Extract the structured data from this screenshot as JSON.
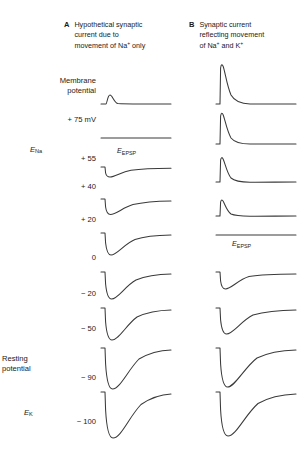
{
  "figure": {
    "trace_color": "#3a3a3a",
    "background": "#ffffff"
  },
  "panels": [
    {
      "id": "A",
      "letter": "A",
      "title": "Hypothetical synaptic\ncurrent due to\nmovement of Na+ only",
      "annotation": "E",
      "annotation_sub": "EPSP",
      "annotation_row": "+ 55"
    },
    {
      "id": "B",
      "letter": "B",
      "title": "Synaptic current\nreflecting movement\nof Na+ and K+",
      "annotation": "E",
      "annotation_sub": "EPSP",
      "annotation_row": "0"
    }
  ],
  "axis": {
    "label_group_1": "Membrane\npotential",
    "label_group_2": "Resting\npotential",
    "unit": "mV"
  },
  "rows": [
    {
      "value": "+ 75 mV",
      "prefix": "Membrane\npotential",
      "symbol": "",
      "symbol_sub": ""
    },
    {
      "value": "+ 55",
      "prefix": "",
      "symbol": "E",
      "symbol_sub": "Na"
    },
    {
      "value": "+ 40",
      "prefix": "",
      "symbol": "",
      "symbol_sub": ""
    },
    {
      "value": "+ 20",
      "prefix": "",
      "symbol": "",
      "symbol_sub": ""
    },
    {
      "value": "0",
      "prefix": "",
      "symbol": "",
      "symbol_sub": ""
    },
    {
      "value": "− 20",
      "prefix": "",
      "symbol": "",
      "symbol_sub": ""
    },
    {
      "value": "− 50",
      "prefix": "",
      "symbol": "",
      "symbol_sub": ""
    },
    {
      "value": "− 90",
      "prefix": "Resting\npotential",
      "symbol": "",
      "symbol_sub": ""
    },
    {
      "value": "− 100",
      "prefix": "",
      "symbol": "E",
      "symbol_sub": "K"
    }
  ],
  "chart_data": {
    "type": "line",
    "xlabel": "Time",
    "ylabel": "Synaptic current",
    "grid": false,
    "legend": "none",
    "note": "Each row is one holding potential. Amplitude is the peak synaptic current in arbitrary units; positive = upward (outward) deflection, negative = downward (inward) deflection. Panel A reverses at +55 mV (E_Na); panel B reverses at 0 mV (E_EPSP).",
    "categories": [
      "+ 75",
      "+ 55",
      "+ 40",
      "+ 20",
      "0",
      "− 20",
      "− 50",
      "− 90",
      "− 100"
    ],
    "series": [
      {
        "name": "A: current due to Na+ only",
        "reversal_potential": "+ 55",
        "values": [
          6,
          0,
          -7,
          -13,
          -22,
          -28,
          -34,
          -44,
          -48
        ]
      },
      {
        "name": "B: current reflecting Na+ and K+",
        "reversal_potential": "0",
        "values": [
          34,
          26,
          19,
          11,
          0,
          -11,
          -20,
          -38,
          -44
        ]
      }
    ]
  }
}
